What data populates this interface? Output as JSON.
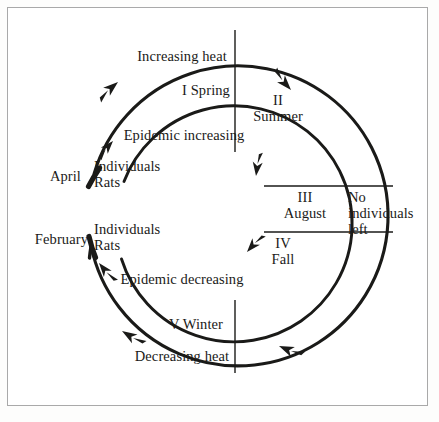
{
  "figure": {
    "type": "cycle-diagram",
    "title_present": false,
    "frame_color": "#a9a9a9",
    "ink_color": "#1a1a18",
    "background": "#ffffff"
  },
  "axis_labels": {
    "top": "Increasing heat",
    "bottom": "Decreasing heat"
  },
  "curve_labels": {
    "increasing": "Epidemic increasing",
    "decreasing": "Epidemic decreasing"
  },
  "endpoint_labels": [
    {
      "month": "April",
      "line1": "Individuals",
      "line2": "Rats"
    },
    {
      "month": "February",
      "line1": "Individuals",
      "line2": "Rats"
    }
  ],
  "sectors": [
    {
      "numeral": "I",
      "name": "Spring",
      "inline": true
    },
    {
      "numeral": "II",
      "name": "Summer",
      "inline": false
    },
    {
      "numeral": "III",
      "name": "August",
      "inline": false
    },
    {
      "numeral": "IV",
      "name": "Fall",
      "inline": false
    },
    {
      "numeral": "V",
      "name": "Winter",
      "inline": true
    }
  ],
  "sector_text": {
    "spring": "I Spring",
    "summer_numeral": "II",
    "summer_name": "Summer",
    "august_numeral": "III",
    "august_name": "August",
    "fall_numeral": "IV",
    "fall_name": "Fall",
    "winter": "V Winter"
  },
  "annotation_right": {
    "line1": "No",
    "line2": "individuals",
    "line3": "left"
  },
  "arrows": [
    {
      "name": "arrow-spring-outer",
      "direction": "northeast",
      "x": 118,
      "y": 82
    },
    {
      "name": "arrow-summer-outer",
      "direction": "southeast",
      "x": 283,
      "y": 80
    },
    {
      "name": "arrow-increasing-inner",
      "direction": "northeast",
      "x": 105,
      "y": 147
    },
    {
      "name": "arrow-summer-inner",
      "direction": "south",
      "x": 255,
      "y": 164
    },
    {
      "name": "arrow-fall-inner",
      "direction": "southwest",
      "x": 253,
      "y": 247
    },
    {
      "name": "arrow-decreasing-inner",
      "direction": "northwest",
      "x": 105,
      "y": 268
    },
    {
      "name": "arrow-winter-outer",
      "direction": "southwest",
      "x": 130,
      "y": 337
    },
    {
      "name": "arrow-fall-outer",
      "direction": "southwest",
      "x": 288,
      "y": 340
    }
  ],
  "geometry": {
    "center_x": 235,
    "center_y": 225,
    "outer_radius": 150,
    "inner_radius": 118,
    "vertical_line_x": 235,
    "horizontal_line_top_y": 186,
    "horizontal_line_bottom_y": 232
  }
}
